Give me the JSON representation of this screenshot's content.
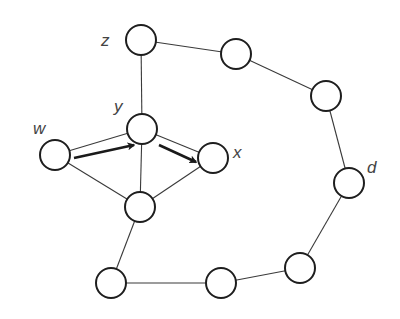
{
  "diagram": {
    "type": "graph",
    "node_radius": 15,
    "nodes": [
      {
        "id": "z",
        "label": "z",
        "cx": 141,
        "cy": 40,
        "label_x": 101,
        "label_y": 46
      },
      {
        "id": "n2",
        "label": "",
        "cx": 236,
        "cy": 54
      },
      {
        "id": "n3",
        "label": "",
        "cx": 326,
        "cy": 96
      },
      {
        "id": "d",
        "label": "d",
        "cx": 349,
        "cy": 183,
        "label_x": 367,
        "label_y": 173
      },
      {
        "id": "n5",
        "label": "",
        "cx": 300,
        "cy": 268
      },
      {
        "id": "n6",
        "label": "",
        "cx": 221,
        "cy": 283
      },
      {
        "id": "n7",
        "label": "",
        "cx": 111,
        "cy": 283
      },
      {
        "id": "n8",
        "label": "",
        "cx": 140,
        "cy": 207
      },
      {
        "id": "y",
        "label": "y",
        "cx": 142,
        "cy": 129,
        "label_x": 114,
        "label_y": 112
      },
      {
        "id": "w",
        "label": "w",
        "cx": 55,
        "cy": 155,
        "label_x": 33,
        "label_y": 134
      },
      {
        "id": "x",
        "label": "x",
        "cx": 213,
        "cy": 158,
        "label_x": 233,
        "label_y": 158
      }
    ],
    "edges": [
      {
        "from": "z",
        "to": "y"
      },
      {
        "from": "z",
        "to": "n2"
      },
      {
        "from": "n2",
        "to": "n3"
      },
      {
        "from": "n3",
        "to": "d"
      },
      {
        "from": "d",
        "to": "n5"
      },
      {
        "from": "n5",
        "to": "n6"
      },
      {
        "from": "n6",
        "to": "n7"
      },
      {
        "from": "n7",
        "to": "n8"
      },
      {
        "from": "n8",
        "to": "y"
      },
      {
        "from": "n8",
        "to": "w"
      },
      {
        "from": "n8",
        "to": "x"
      },
      {
        "from": "w",
        "to": "y"
      },
      {
        "from": "y",
        "to": "x"
      }
    ],
    "arrows": [
      {
        "from": "w",
        "to": "y",
        "x1": 74,
        "y1": 158,
        "x2": 134,
        "y2": 145
      },
      {
        "from": "y",
        "to": "x",
        "x1": 159,
        "y1": 145,
        "x2": 196,
        "y2": 162
      }
    ],
    "colors": {
      "node_stroke": "#1e1e1e",
      "node_fill": "#ffffff",
      "edge": "#3a3a3a",
      "arrow": "#1a1a1a",
      "label": "#444444"
    }
  }
}
